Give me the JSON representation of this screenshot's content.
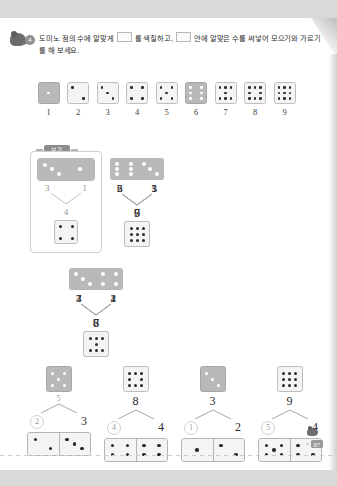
{
  "header": {
    "badge_number": "4",
    "icon": "mouse-mascot-icon",
    "text_part1": "도미노 점의 수에 알맞게",
    "text_part2": "를 색칠하고,",
    "text_part3": "안에 알맞은 수를 써넣어 모으기와 가르기를",
    "text_part4": "해 보세요."
  },
  "reference_strip": {
    "name": "dice-reference-1-to-9",
    "cells": [
      {
        "label": "1",
        "pips": 1,
        "filled": true
      },
      {
        "label": "2",
        "pips": 2,
        "filled": false
      },
      {
        "label": "3",
        "pips": 3,
        "filled": false
      },
      {
        "label": "4",
        "pips": 4,
        "filled": false
      },
      {
        "label": "5",
        "pips": 5,
        "filled": false
      },
      {
        "label": "6",
        "pips": 6,
        "filled": true
      },
      {
        "label": "7",
        "pips": 7,
        "filled": false
      },
      {
        "label": "8",
        "pips": 8,
        "filled": false
      },
      {
        "label": "9",
        "pips": 9,
        "filled": false
      }
    ]
  },
  "example": {
    "tag_label": "보기",
    "domino": {
      "left": 3,
      "right": 1
    },
    "left_number": "3",
    "right_number": "1",
    "sum": "4",
    "result_pips": 4
  },
  "merge_groups_row1": [
    {
      "name": "merge-group-2-5",
      "domino": {
        "left": 2,
        "right": 5
      },
      "left_number": "2",
      "right_number": "5",
      "sum": "7",
      "result_pips": 7
    },
    {
      "name": "merge-group-5-1",
      "domino": {
        "left": 5,
        "right": 1
      },
      "left_number": "5",
      "right_number": "1",
      "sum": "6",
      "result_pips": 6
    },
    {
      "name": "merge-group-6-3",
      "domino": {
        "left": 6,
        "right": 3
      },
      "left_number": "6",
      "right_number": "3",
      "sum": "9",
      "result_pips": 9
    }
  ],
  "merge_groups_row2": [
    {
      "name": "merge-group-4-2",
      "domino": {
        "left": 4,
        "right": 2
      },
      "left_number": "4",
      "right_number": "2",
      "sum": "6",
      "result_pips": 6
    },
    {
      "name": "merge-group-7-1",
      "domino": {
        "left": 7,
        "right": 1
      },
      "left_number": "7",
      "right_number": "1",
      "sum": "8",
      "result_pips": 8
    },
    {
      "name": "merge-group-3-4",
      "domino": {
        "left": 3,
        "right": 4
      },
      "left_number": "3",
      "right_number": "4",
      "sum": "7",
      "result_pips": 7
    }
  ],
  "split_groups": [
    {
      "name": "split-group-5",
      "total_pips": 5,
      "total_number": "5",
      "left_number": "2",
      "right_number": "3",
      "domino": {
        "left": 2,
        "right": 3
      }
    },
    {
      "name": "split-group-8",
      "total_pips": 8,
      "total_number": "8",
      "left_number": "4",
      "right_number": "4",
      "domino": {
        "left": 4,
        "right": 4
      }
    },
    {
      "name": "split-group-3",
      "total_pips": 3,
      "total_number": "3",
      "left_number": "1",
      "right_number": "2",
      "domino": {
        "left": 1,
        "right": 2
      }
    },
    {
      "name": "split-group-9",
      "total_pips": 9,
      "total_number": "9",
      "left_number": "5",
      "right_number": "4",
      "domino": {
        "left": 5,
        "right": 4
      }
    }
  ],
  "footer": {
    "page_number": "07",
    "dot": "•"
  },
  "colors": {
    "page_background": "#ffffff",
    "outer_background": "#d9d9d9",
    "die_filled": "#b9b9b9",
    "die_empty": "#f4f4f4",
    "die_border": "#bdbdbd",
    "pip_light": "#ffffff",
    "pip_dark": "#2b2b2b",
    "text": "#2b2b2b"
  }
}
